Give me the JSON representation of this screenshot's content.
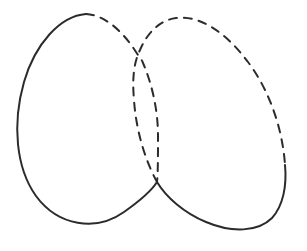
{
  "figure": {
    "description": "Hand-drawn style line diagram of two intersecting oblique ellipses; each ellipse is partly solid and partly dashed to indicate which arc passes behind the other.",
    "background_color": "#ffffff",
    "canvas": {
      "width": 307,
      "height": 251
    },
    "style": {
      "stroke_color": "#2b2b2b",
      "stroke_width": 2,
      "dash_length": 8,
      "dash_gap": 7,
      "dash_array": "8 7",
      "line_cap": "round"
    },
    "intersections": [
      {
        "name": "upper-crossing",
        "x": 140,
        "y": 60
      },
      {
        "name": "lower-crossing",
        "x": 157,
        "y": 182
      }
    ],
    "shapes": [
      {
        "id": "left-ellipse",
        "name": "left-ellipse",
        "label": "Left ellipse",
        "center": {
          "x": 88,
          "y": 110
        },
        "radius_x": 68,
        "radius_y": 100,
        "rotation_deg": 22,
        "solid_path": "M 86 14 C 60 16 35 44 24 82 C 12 124 16 168 36 196 C 58 226 96 232 124 212 C 141 200 152 190 157 182",
        "dashed_path": "M 86 14 C 104 15 122 30 136 52 C 140 58 142 60 143 63 C 152 84 158 110 158 136 C 158 156 158 172 157 182",
        "solid_portion": "left, top-left, bottom",
        "dashed_portion": "top-right and right side"
      },
      {
        "id": "right-ellipse",
        "name": "right-ellipse",
        "label": "Right ellipse",
        "center": {
          "x": 212,
          "y": 112
        },
        "radius_x": 70,
        "radius_y": 100,
        "rotation_deg": 26,
        "solid_path": "M 285 165 C 287 186 283 206 272 218 C 258 232 232 233 206 222 C 184 213 166 197 157 182",
        "dashed_path": "M 157 182 C 145 160 136 130 134 100 C 132 78 134 62 140 50 C 147 33 160 20 176 18 C 198 15 224 30 248 62 C 272 94 283 134 285 165",
        "solid_portion": "bottom and lower-right",
        "dashed_portion": "left, top and upper-right"
      }
    ]
  }
}
